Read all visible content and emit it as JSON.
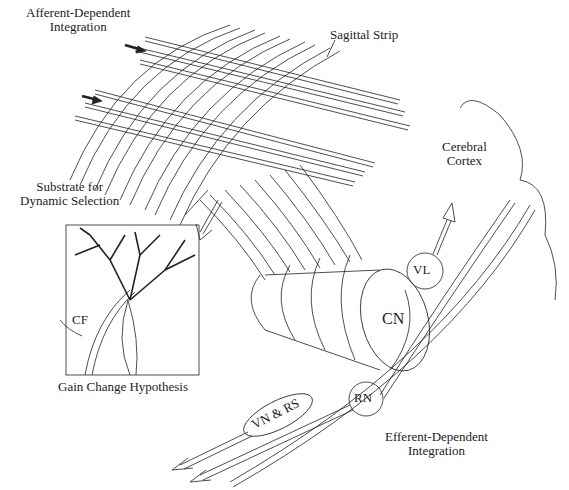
{
  "diagram": {
    "type": "neuroanatomical schematic",
    "labels": {
      "afferent_line1": "Afferent-Dependent",
      "afferent_line2": "Integration",
      "sagittal_strip": "Sagittal Strip",
      "cerebral_line1": "Cerebral",
      "cerebral_line2": "Cortex",
      "substrate_line1": "Substrate for",
      "substrate_line2": "Dynamic Selection",
      "cf": "CF",
      "gain_change": "Gain Change Hypothesis",
      "vl": "VL",
      "cn": "CN",
      "vn_rs": "VN & RS",
      "rn": "RN",
      "efferent_line1": "Efferent-Dependent",
      "efferent_line2": "Integration"
    },
    "nodes": [
      {
        "id": "VL",
        "shape": "circle"
      },
      {
        "id": "CN",
        "shape": "cylinder"
      },
      {
        "id": "VN & RS",
        "shape": "ellipse"
      },
      {
        "id": "RN",
        "shape": "circle"
      }
    ],
    "colors": {
      "ink": "#1a1a1a",
      "background": "#ffffff"
    }
  }
}
